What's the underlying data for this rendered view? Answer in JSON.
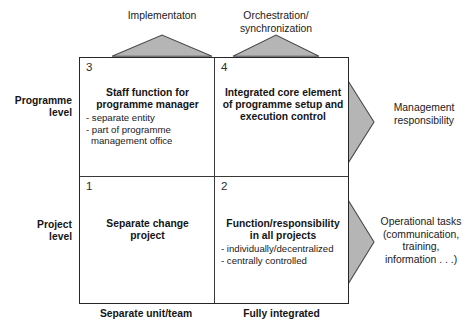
{
  "diagram": {
    "top_labels": [
      {
        "text_lines": [
          "Implementaton"
        ],
        "line1": "Implementaton",
        "line2": ""
      },
      {
        "text_lines": [
          "Orchestration/",
          "synchronization"
        ],
        "line1": "Orchestration/",
        "line2": "synchronization"
      }
    ],
    "left_labels": [
      {
        "line1": "Programme",
        "line2": "level"
      },
      {
        "line1": "Project",
        "line2": "level"
      }
    ],
    "bottom_labels": [
      {
        "text": "Separate unit/team"
      },
      {
        "text": "Fully integrated"
      }
    ],
    "right_labels": [
      {
        "line1": "Management",
        "line2": "responsibility",
        "line3": "",
        "line4": ""
      },
      {
        "line1": "Operational tasks",
        "line2": "(communication,",
        "line3": "training,",
        "line4": "information . . .)"
      }
    ],
    "quadrants": {
      "q1": {
        "number": "1",
        "title_line1": "Separate change",
        "title_line2": "project",
        "bullets": []
      },
      "q2": {
        "number": "2",
        "title_line1": "Function/responsibility",
        "title_line2": "in all projects",
        "bullets": [
          "- individually/decentralized",
          "- centrally controlled"
        ]
      },
      "q3": {
        "number": "3",
        "title_line1": "Staff function for",
        "title_line2": "programme manager",
        "bullets": [
          "- separate entity",
          "- part of programme",
          "management office"
        ]
      },
      "q4": {
        "number": "4",
        "title_line1": "Integrated core element",
        "title_line2": "of programme setup and",
        "title_line3": "execution control",
        "bullets": []
      }
    },
    "colors": {
      "arrow_fill": "#b5b5b5",
      "arrow_stroke": "#4a4a4a",
      "box_border": "#262626",
      "text": "#1a1a1a"
    }
  }
}
